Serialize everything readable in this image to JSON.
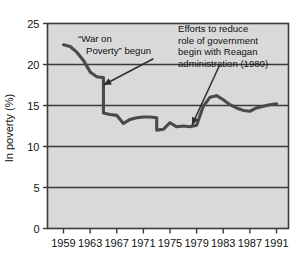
{
  "chart_data": {
    "type": "line",
    "title": "",
    "subtitle": "",
    "xlabel": "",
    "ylabel": "In poverty (%)",
    "xlim": [
      1959,
      1991
    ],
    "ylim": [
      0,
      25
    ],
    "ytick_labels": [
      "0",
      "5",
      "10",
      "15",
      "20",
      "25"
    ],
    "ytick_values": [
      0,
      5,
      10,
      15,
      20,
      25
    ],
    "xtick_labels": [
      "1959",
      "1963",
      "1967",
      "1971",
      "1975",
      "1979",
      "1983",
      "1987",
      "1991"
    ],
    "xtick_values": [
      1959,
      1963,
      1967,
      1971,
      1975,
      1979,
      1983,
      1987,
      1991
    ],
    "grid": "horizontal",
    "legend": "none",
    "plot_background": "#d9d9d9",
    "line_color": "#4a4a4a",
    "series": [
      {
        "name": "In poverty (%)",
        "x": [
          1959,
          1960,
          1961,
          1962,
          1963,
          1964,
          1965,
          1965,
          1966,
          1967,
          1968,
          1969,
          1970,
          1971,
          1972,
          1973,
          1973,
          1974,
          1975,
          1976,
          1977,
          1978,
          1979,
          1980,
          1981,
          1982,
          1983,
          1984,
          1985,
          1986,
          1987,
          1988,
          1989,
          1990,
          1991
        ],
        "y": [
          22.4,
          22.2,
          21.5,
          20.5,
          19.1,
          18.5,
          18.4,
          14.1,
          13.9,
          13.8,
          12.8,
          13.3,
          13.5,
          13.6,
          13.6,
          13.5,
          12.0,
          12.1,
          12.9,
          12.4,
          12.5,
          12.4,
          12.6,
          14.9,
          16.0,
          16.2,
          15.7,
          15.1,
          14.7,
          14.4,
          14.3,
          14.7,
          14.9,
          15.1,
          15.2
        ]
      }
    ],
    "annotations": [
      {
        "id": "war-on-poverty",
        "lines": [
          "“War on",
          "Poverty” begun"
        ],
        "arrow_from": [
          1972.5,
          20.7
        ],
        "arrow_to": [
          1965.0,
          17.5
        ]
      },
      {
        "id": "reagan-efforts",
        "lines": [
          "Efforts to reduce",
          "role of government",
          "begin with Reagan",
          "administration (1980)"
        ],
        "arrow_from": [
          1982.5,
          20.0
        ],
        "arrow_to": [
          1978.3,
          12.6
        ]
      }
    ]
  }
}
